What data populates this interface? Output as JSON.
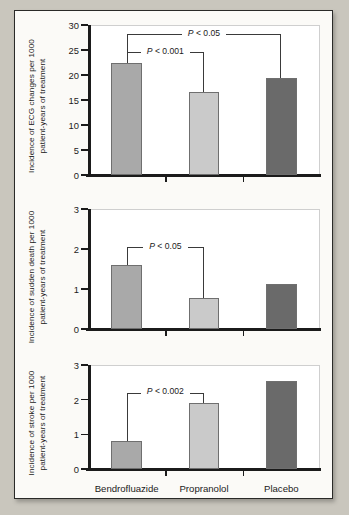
{
  "figure": {
    "background_color": "#c9c6bd",
    "panel_background": "#ffffff",
    "categories": [
      "Bendrofluazide",
      "Propranolol",
      "Placebo"
    ],
    "bar_colors": [
      "#a9a9a9",
      "#cacaca",
      "#6a6a6a"
    ]
  },
  "chart_data": [
    {
      "type": "bar",
      "title": "",
      "xlabel": "",
      "ylabel": "Incidence of ECG changes per 1000 patient-years of treatment",
      "categories": [
        "Bendrofluazide",
        "Propranolol",
        "Placebo"
      ],
      "values": [
        22.5,
        16.6,
        19.5
      ],
      "ylim": [
        0,
        30
      ],
      "yticks": [
        0,
        5,
        10,
        15,
        20,
        25,
        30
      ],
      "ytick_labels": [
        "0",
        "5",
        "10",
        "15",
        "20",
        "25",
        "30"
      ],
      "grid": false,
      "legend": "none",
      "annotations": [
        {
          "text": "P < 0.05",
          "from": "Bendrofluazide",
          "to": "Placebo",
          "level": 28.2
        },
        {
          "text": "P < 0.001",
          "from": "Bendrofluazide",
          "to": "Propranolol",
          "level": 24.6
        }
      ]
    },
    {
      "type": "bar",
      "title": "",
      "xlabel": "",
      "ylabel": "Incidence of sudden death per 1000 patient-years of treatment",
      "categories": [
        "Bendrofluazide",
        "Propranolol",
        "Placebo"
      ],
      "values": [
        1.6,
        0.78,
        1.12
      ],
      "ylim": [
        0,
        3
      ],
      "yticks": [
        0,
        1,
        2,
        3
      ],
      "ytick_labels": [
        "0",
        "1",
        "2",
        "3"
      ],
      "grid": false,
      "legend": "none",
      "annotations": [
        {
          "text": "P < 0.05",
          "from": "Bendrofluazide",
          "to": "Propranolol",
          "level": 2.05
        }
      ]
    },
    {
      "type": "bar",
      "title": "",
      "xlabel": "",
      "ylabel": "Incidence of stroke per 1000 patient-years of treatment",
      "categories": [
        "Bendrofluazide",
        "Propranolol",
        "Placebo"
      ],
      "values": [
        0.8,
        1.9,
        2.55
      ],
      "ylim": [
        0,
        3
      ],
      "yticks": [
        0,
        1,
        2,
        3
      ],
      "ytick_labels": [
        "0",
        "1",
        "2",
        "3"
      ],
      "grid": false,
      "legend": "none",
      "annotations": [
        {
          "text": "P < 0.002",
          "from": "Bendrofluazide",
          "to": "Propranolol",
          "level": 2.2
        }
      ]
    }
  ]
}
